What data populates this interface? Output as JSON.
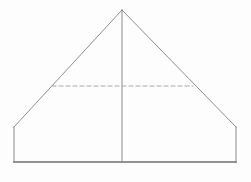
{
  "figure": {
    "canvas": {
      "width": 251,
      "height": 182,
      "background_color": "#fdfdfd"
    },
    "colors": {
      "diagonal_stroke": "#8e8e8e",
      "vertical_stroke": "#8a8a8a",
      "base_stroke": "#6f6f6f",
      "dashed_stroke": "#a9a9a9",
      "background": "#fdfdfd"
    },
    "stroke_widths": {
      "diagonal": 1,
      "vertical": 1,
      "base": 1.6,
      "dashed": 1
    },
    "points": {
      "apex": {
        "label": "apex",
        "x": 122,
        "y": 10
      },
      "left_eave": {
        "label": "left-eave",
        "x": 14,
        "y": 127
      },
      "right_eave": {
        "label": "right-eave",
        "x": 236,
        "y": 127
      },
      "left_base": {
        "label": "left-base",
        "x": 14,
        "y": 162
      },
      "right_base": {
        "label": "right-base",
        "x": 236,
        "y": 162
      },
      "center_base": {
        "label": "center-base",
        "x": 122,
        "y": 162
      },
      "dash_left": {
        "label": "dash-left",
        "x": 52,
        "y": 86
      },
      "dash_right": {
        "label": "dash-right",
        "x": 193,
        "y": 86
      }
    },
    "segments": [
      {
        "name": "left-roof-edge",
        "kind": "solid",
        "x1": 122,
        "y1": 10,
        "x2": 14,
        "y2": 127
      },
      {
        "name": "right-roof-edge",
        "kind": "solid",
        "x1": 122,
        "y1": 10,
        "x2": 236,
        "y2": 127
      },
      {
        "name": "left-wall-edge",
        "kind": "solid",
        "x1": 14,
        "y1": 127,
        "x2": 14,
        "y2": 162
      },
      {
        "name": "right-wall-edge",
        "kind": "solid",
        "x1": 236,
        "y1": 127,
        "x2": 236,
        "y2": 162
      },
      {
        "name": "base-edge",
        "kind": "solid",
        "x1": 14,
        "y1": 162,
        "x2": 236,
        "y2": 162
      },
      {
        "name": "center-axis",
        "kind": "solid",
        "x1": 122,
        "y1": 10,
        "x2": 122,
        "y2": 162
      },
      {
        "name": "hidden-cross-section",
        "kind": "dashed",
        "x1": 52,
        "y1": 86,
        "x2": 193,
        "y2": 86,
        "dash_pattern": "4 3"
      }
    ]
  }
}
